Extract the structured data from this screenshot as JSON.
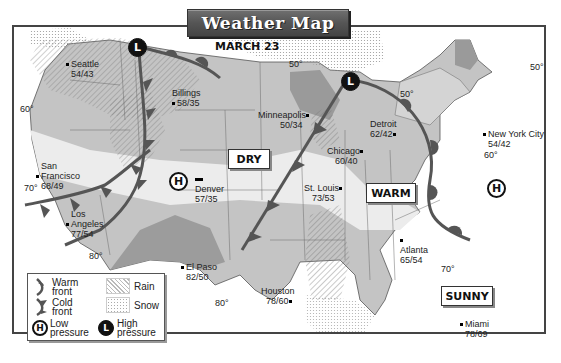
{
  "title": "Weather Map",
  "date": "MARCH 23",
  "cities": [
    {
      "name": "Seattle",
      "temps": "54/43"
    },
    {
      "name": "Billings",
      "temps": "58/35"
    },
    {
      "name": "Minneapolis",
      "temps": "50/34"
    },
    {
      "name": "Detroit",
      "temps": "62/42"
    },
    {
      "name": "New York City",
      "temps": "54/42"
    },
    {
      "name": "Chicago",
      "temps": "60/40"
    },
    {
      "name": "San Francisco",
      "name_line1": "San",
      "name_line2": "Francisco",
      "temps": "68/49"
    },
    {
      "name": "Denver",
      "temps": "57/35"
    },
    {
      "name": "St. Louis",
      "temps": "73/53"
    },
    {
      "name": "Los Angeles",
      "name_line1": "Los",
      "name_line2": "Angeles",
      "temps": "77/54"
    },
    {
      "name": "Atlanta",
      "temps": "65/54"
    },
    {
      "name": "El Paso",
      "temps": "82/50"
    },
    {
      "name": "Houston",
      "temps": "78/60"
    },
    {
      "name": "Miami",
      "temps": "78/69"
    }
  ],
  "isotherms": [
    {
      "label": "60°",
      "position": "west-coast-north"
    },
    {
      "label": "70°",
      "position": "west-coast-south"
    },
    {
      "label": "80°",
      "position": "southwest"
    },
    {
      "label": "80°",
      "position": "texas"
    },
    {
      "label": "50°",
      "position": "upper-midwest"
    },
    {
      "label": "50°",
      "position": "great-lakes"
    },
    {
      "label": "50°",
      "position": "maine"
    },
    {
      "label": "60°",
      "position": "mid-atlantic"
    },
    {
      "label": "70°",
      "position": "southeast"
    }
  ],
  "condition_tags": [
    {
      "label": "DRY"
    },
    {
      "label": "WARM"
    },
    {
      "label": "SUNNY"
    }
  ],
  "pressure_systems": [
    {
      "type": "high",
      "symbol": "L",
      "location": "northern-rockies"
    },
    {
      "type": "high",
      "symbol": "L",
      "location": "great-lakes"
    },
    {
      "type": "low",
      "symbol": "H",
      "location": "colorado"
    },
    {
      "type": "low",
      "symbol": "H",
      "location": "atlantic-coast"
    }
  ],
  "legend": {
    "warm_front": [
      "Warm",
      "front"
    ],
    "cold_front": [
      "Cold",
      "front"
    ],
    "low_pressure": [
      "Low",
      "pressure"
    ],
    "high_pressure": [
      "High",
      "pressure"
    ],
    "rain": "Rain",
    "snow": "Snow",
    "low_symbol": "H",
    "high_symbol": "L"
  },
  "colors": {
    "land_light": "#d9d9d9",
    "land_medium": "#b3b3b3",
    "land_dark": "#8c8c8c",
    "warm_band": "#ececec",
    "front": "#555555",
    "border": "#444444"
  }
}
